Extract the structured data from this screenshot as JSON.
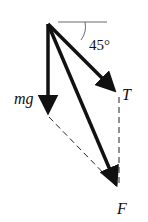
{
  "diagram": {
    "type": "force-vector-diagram",
    "angle_label": "45°",
    "vectors": [
      {
        "name": "mg",
        "label": "mg",
        "direction": "down"
      },
      {
        "name": "T",
        "label": "T",
        "direction": "down-right at 45° below horizontal"
      },
      {
        "name": "F",
        "label": "F",
        "direction": "resultant of mg and T"
      }
    ],
    "construction_lines": [
      "dashed line from mg tip to F tip",
      "dashed vertical line from T tip to F tip"
    ],
    "colors": {
      "stroke": "#111111",
      "background": "#ffffff"
    }
  }
}
